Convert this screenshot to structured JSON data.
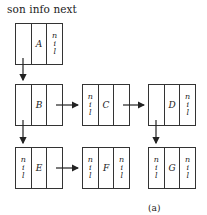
{
  "header": {
    "text": "son info next"
  },
  "nodes": {
    "A": {
      "son": "",
      "info": "A",
      "next": "nil"
    },
    "B": {
      "son": "",
      "info": "B",
      "next": ""
    },
    "C": {
      "son": "nil",
      "info": "C",
      "next": ""
    },
    "D": {
      "son": "",
      "info": "D",
      "next": "nil"
    },
    "E": {
      "son": "nil",
      "info": "E",
      "next": ""
    },
    "F": {
      "son": "nil",
      "info": "F",
      "next": "nil"
    },
    "G": {
      "son": "nil",
      "info": "G",
      "next": "nil"
    }
  },
  "nil_letters": [
    "n",
    "i",
    "l"
  ],
  "edges": [
    {
      "from": "A",
      "to": "B",
      "type": "son"
    },
    {
      "from": "B",
      "to": "C",
      "type": "next"
    },
    {
      "from": "C",
      "to": "D",
      "type": "next"
    },
    {
      "from": "B",
      "to": "E",
      "type": "son"
    },
    {
      "from": "E",
      "to": "F",
      "type": "next"
    },
    {
      "from": "D",
      "to": "G",
      "type": "son"
    }
  ],
  "caption": "(a)"
}
